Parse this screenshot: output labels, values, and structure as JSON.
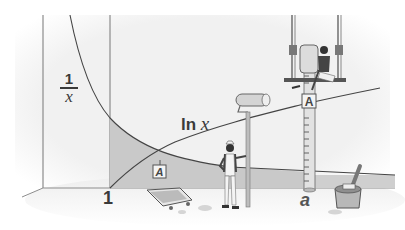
{
  "figure": {
    "labels": {
      "reciprocal_numerator": "1",
      "reciprocal_denominator": "x",
      "log_function": "ln",
      "log_variable": "x",
      "x_tick_one": "1",
      "x_tick_a": "a",
      "area_sign_ground": "A",
      "area_sign_pole": "A"
    },
    "colors": {
      "background": "#ffffff",
      "floor": "#eeeeee",
      "wall": "#f3f3f3",
      "shaded_area": "#c8c8c8",
      "curve": "#444444",
      "text": "#3a3a3a"
    }
  }
}
